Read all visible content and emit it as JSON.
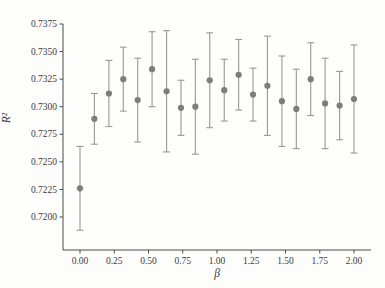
{
  "figure": {
    "background": "#fdfdfc"
  },
  "chart_data": {
    "type": "scatter",
    "subtype": "points-with-error-bars",
    "title": "",
    "xlabel": "β",
    "ylabel": "R²",
    "grid": false,
    "xlim": [
      -0.12,
      2.12
    ],
    "ylim": [
      0.717,
      0.7375
    ],
    "x": [
      0.0,
      0.105,
      0.211,
      0.316,
      0.421,
      0.526,
      0.632,
      0.737,
      0.842,
      0.947,
      1.053,
      1.158,
      1.263,
      1.368,
      1.474,
      1.579,
      1.684,
      1.789,
      1.895,
      2.0
    ],
    "y": [
      0.7226,
      0.7289,
      0.7312,
      0.7325,
      0.7306,
      0.7334,
      0.7314,
      0.7299,
      0.73,
      0.7324,
      0.7315,
      0.7329,
      0.7311,
      0.7319,
      0.7305,
      0.7298,
      0.7325,
      0.7303,
      0.7301,
      0.7307
    ],
    "yerr": [
      0.0038,
      0.0023,
      0.003,
      0.0029,
      0.0038,
      0.0034,
      0.0055,
      0.0025,
      0.0043,
      0.0043,
      0.0028,
      0.0032,
      0.0024,
      0.0045,
      0.0041,
      0.0036,
      0.0033,
      0.0041,
      0.0031,
      0.0049
    ],
    "xticks": {
      "values": [
        0.0,
        0.25,
        0.5,
        0.75,
        1.0,
        1.25,
        1.5,
        1.75,
        2.0
      ],
      "labels": [
        "0.00",
        "0.25",
        "0.50",
        "0.75",
        "1.00",
        "1.25",
        "1.50",
        "1.75",
        "2.00"
      ]
    },
    "yticks": {
      "values": [
        0.7375,
        0.735,
        0.7325,
        0.73,
        0.7275,
        0.725,
        0.7225,
        0.72
      ],
      "labels": [
        "0.7375",
        "0.7350",
        "0.7325",
        "0.7300",
        "0.7275",
        "0.7250",
        "0.7225",
        "0.7200"
      ]
    },
    "colors": {
      "marker": "#7d7d7d",
      "error_bar": "#989898",
      "axis": "#4a4a4a",
      "tick_label": "#3c3c3c"
    }
  }
}
